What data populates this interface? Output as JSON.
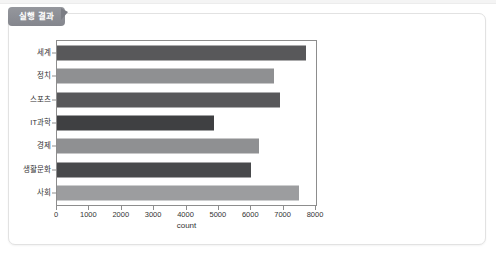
{
  "panel": {
    "tab_label": "실행 결과",
    "tab_pointer_icon": "tab-pointer-triangle-icon",
    "accent_color": "#8d8f96",
    "panel_border_color": "#e2e2e2"
  },
  "chart_data": {
    "type": "bar",
    "orientation": "horizontal",
    "title": "",
    "subtitle": "",
    "xlabel": "count",
    "ylabel": "",
    "categories": [
      "세계",
      "정치",
      "스포츠",
      "IT과학",
      "경제",
      "생활문화",
      "사회"
    ],
    "values": [
      7700,
      6700,
      6900,
      4860,
      6250,
      6000,
      7470
    ],
    "xlim": [
      0,
      8000
    ],
    "xticks": [
      0,
      1000,
      2000,
      3000,
      4000,
      5000,
      6000,
      7000,
      8000
    ],
    "xtick_labels": [
      "0",
      "1000",
      "2000",
      "3000",
      "4000",
      "5000",
      "6000",
      "7000",
      "8000"
    ],
    "bar_colors": [
      "#58585a",
      "#8f9092",
      "#58585a",
      "#3f4042",
      "#8f9092",
      "#48494b",
      "#9c9d9f"
    ],
    "grid": false,
    "legend": null,
    "frame_color": "#8d8d8d"
  }
}
